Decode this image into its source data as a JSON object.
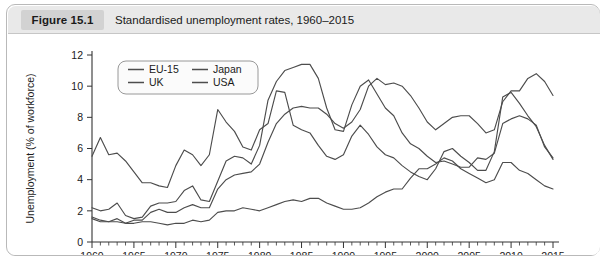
{
  "figure": {
    "number_label": "Figure 15.1",
    "title": "Standardised unemployment rates, 1960–2015"
  },
  "chart_data": {
    "type": "line",
    "title": "Standardised unemployment rates, 1960–2015",
    "xlabel": "",
    "ylabel": "Unemployment (% of workforce)",
    "xlim": [
      1960,
      2015
    ],
    "ylim": [
      0,
      12
    ],
    "ytick_values": [
      0,
      2,
      4,
      6,
      8,
      10,
      12
    ],
    "xtick_values": [
      1960,
      1965,
      1970,
      1975,
      1980,
      1985,
      1990,
      1995,
      2000,
      2005,
      2010,
      2015
    ],
    "xtick_labels": [
      "1960",
      "1965",
      "1970",
      "1975",
      "1980",
      "1985",
      "1990",
      "1995",
      "2000",
      "2005",
      "2010",
      "2015"
    ],
    "ytick_labels": [
      "0",
      "2",
      "4",
      "6",
      "8",
      "10",
      "12"
    ],
    "minor_xticks": "every 1 year",
    "grid": false,
    "legend_position": "top-left inside plot",
    "line_color": "#4d4d4d",
    "x": [
      1960,
      1961,
      1962,
      1963,
      1964,
      1965,
      1966,
      1967,
      1968,
      1969,
      1970,
      1971,
      1972,
      1973,
      1974,
      1975,
      1976,
      1977,
      1978,
      1979,
      1980,
      1981,
      1982,
      1983,
      1984,
      1985,
      1986,
      1987,
      1988,
      1989,
      1990,
      1991,
      1992,
      1993,
      1994,
      1995,
      1996,
      1997,
      1998,
      1999,
      2000,
      2001,
      2002,
      2003,
      2004,
      2005,
      2006,
      2007,
      2008,
      2009,
      2010,
      2011,
      2012,
      2013,
      2014,
      2015
    ],
    "series": [
      {
        "name": "EU-15",
        "values": [
          1.5,
          1.3,
          1.3,
          1.5,
          1.2,
          1.4,
          1.4,
          1.9,
          2.1,
          1.9,
          1.9,
          2.2,
          2.4,
          2.2,
          2.2,
          3.4,
          4.0,
          4.3,
          4.4,
          4.5,
          5.0,
          6.4,
          7.6,
          8.2,
          8.6,
          8.7,
          8.6,
          8.6,
          8.2,
          7.6,
          7.3,
          7.7,
          8.5,
          10.0,
          10.5,
          10.1,
          10.2,
          10.0,
          9.4,
          8.6,
          7.7,
          7.2,
          7.6,
          8.0,
          8.1,
          8.1,
          7.6,
          7.0,
          7.2,
          9.0,
          9.7,
          9.7,
          10.5,
          10.8,
          10.3,
          9.4
        ]
      },
      {
        "name": "Japan",
        "values": [
          1.6,
          1.4,
          1.3,
          1.3,
          1.2,
          1.2,
          1.3,
          1.3,
          1.2,
          1.1,
          1.2,
          1.2,
          1.4,
          1.3,
          1.4,
          1.9,
          2.0,
          2.0,
          2.2,
          2.1,
          2.0,
          2.2,
          2.4,
          2.6,
          2.7,
          2.6,
          2.8,
          2.8,
          2.5,
          2.3,
          2.1,
          2.1,
          2.2,
          2.5,
          2.9,
          3.2,
          3.4,
          3.4,
          4.1,
          4.7,
          4.7,
          5.0,
          5.4,
          5.2,
          4.7,
          4.4,
          4.1,
          3.8,
          4.0,
          5.1,
          5.1,
          4.6,
          4.4,
          4.0,
          3.6,
          3.4
        ]
      },
      {
        "name": "UK",
        "values": [
          2.2,
          2.0,
          2.1,
          2.5,
          1.7,
          1.5,
          1.6,
          2.3,
          2.5,
          2.5,
          2.6,
          3.3,
          3.6,
          2.7,
          2.6,
          3.9,
          5.2,
          5.5,
          5.4,
          5.0,
          6.2,
          9.1,
          10.3,
          11.0,
          11.2,
          11.4,
          11.4,
          10.5,
          8.6,
          7.2,
          7.1,
          8.8,
          10.0,
          10.4,
          9.5,
          8.6,
          8.1,
          7.0,
          6.3,
          6.0,
          5.5,
          5.1,
          5.2,
          5.0,
          4.8,
          4.8,
          5.4,
          5.3,
          5.7,
          7.6,
          7.9,
          8.1,
          7.9,
          7.5,
          6.1,
          5.4
        ]
      },
      {
        "name": "USA",
        "values": [
          5.5,
          6.7,
          5.6,
          5.7,
          5.2,
          4.5,
          3.8,
          3.8,
          3.6,
          3.5,
          4.9,
          5.9,
          5.6,
          4.9,
          5.6,
          8.5,
          7.7,
          7.1,
          6.1,
          5.9,
          7.2,
          7.6,
          9.7,
          9.6,
          7.5,
          7.2,
          7.0,
          6.2,
          5.5,
          5.3,
          5.6,
          6.8,
          7.5,
          6.9,
          6.1,
          5.6,
          5.4,
          4.9,
          4.5,
          4.2,
          4.0,
          4.7,
          5.8,
          6.0,
          5.5,
          5.1,
          4.6,
          4.6,
          5.8,
          9.3,
          9.6,
          8.9,
          8.1,
          7.4,
          6.2,
          5.3
        ]
      }
    ],
    "legend_entries": [
      "EU-15",
      "Japan",
      "UK",
      "USA"
    ]
  }
}
